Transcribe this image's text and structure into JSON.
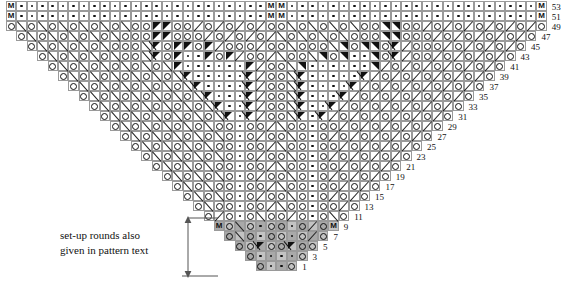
{
  "document": {
    "kind": "knitting-chart",
    "shape": "triangular-shawl-chart",
    "width": 562,
    "height": 281
  },
  "caption": {
    "line1": "set-up rounds also",
    "line2": "given in pattern text"
  },
  "legend_symbols": {
    "yarn_over": "o",
    "purl": "dot",
    "marker": "M",
    "k2tog": "forward-slash",
    "ssk": "back-slash",
    "filled_decrease": "solid-triangle",
    "centered_decrease": "triangle-with-slash",
    "setup_shading_dark": "#a9a9a9",
    "setup_shading_light": "#c3c3c3"
  },
  "colors": {
    "grid_line": "#9a9a9a",
    "grid_line_faint": "#c8c8c8",
    "symbol": "#111111",
    "background": "#ffffff",
    "setup_dark": "#a9a9a9",
    "setup_light": "#c3c3c3"
  },
  "grid": {
    "cell_width": 10.4,
    "cell_height": 10.0,
    "origin_x": 6,
    "origin_y": 1,
    "columns": 52,
    "rows": 27
  },
  "row_numbers": [
    1,
    3,
    5,
    7,
    9,
    11,
    13,
    15,
    17,
    19,
    21,
    23,
    25,
    27,
    29,
    31,
    33,
    35,
    37,
    39,
    41,
    43,
    45,
    47,
    49,
    51,
    53
  ],
  "setup_rows": [
    1,
    3,
    5,
    7,
    9
  ],
  "chart_data": {
    "type": "table",
    "title": "",
    "note": "Triangular lace shawl chart. Rows numbered on the right, odd numbers only, 1 at bottom to 53 at top. Each row grows wider by one stitch on each side of centre. Rows 1-9 are shaded set-up rounds.",
    "rows": [
      {
        "n": 1,
        "half": "o . o",
        "cells": 4
      },
      {
        "n": 3,
        "half": "o . . o",
        "cells": 6
      },
      {
        "n": 5,
        "half": "o o A o o",
        "cells": 8
      },
      {
        "n": 7,
        "half": "o / o . o \\ o",
        "cells": 10
      },
      {
        "n": 9,
        "half": "M o / o . o \\ o",
        "cells": 12
      },
      {
        "n": 11,
        "half": "o \\ o . o / o / o",
        "cells": 14
      },
      {
        "n": 13,
        "half": "o / o o . o o \\ o",
        "cells": 16
      },
      {
        "n": 15,
        "half": "o / o / o . o \\ o \\ o",
        "cells": 18
      },
      {
        "n": 17,
        "half": "o / o / o o . o o \\ o \\ o",
        "cells": 20
      },
      {
        "n": 19,
        "half": "o / o / o / o . o \\ o \\ o \\ o",
        "cells": 22
      },
      {
        "n": 21,
        "half": "o / o / o / o o . o o \\ o \\ o \\ o",
        "cells": 24
      },
      {
        "n": 23,
        "half": "o / o / o / o / o . o \\ o \\ o \\ o \\ o",
        "cells": 26
      },
      {
        "n": 25,
        "half": "o / o / o / o / o o . o o \\ o \\ o \\ o \\ o",
        "cells": 28
      },
      {
        "n": 27,
        "half": "o / o / o / o / o / o . o \\ o \\ o \\ o \\ o \\ o",
        "cells": 30
      },
      {
        "n": 29,
        "half": "o / o / o / o / o / o o . o o \\ o \\ o \\ o \\ o \\ o",
        "cells": 32
      },
      {
        "n": 31,
        "half": "o / o / o / o / o / o / A . A \\ o \\ o \\ o \\ o \\ o \\ o",
        "cells": 34
      },
      {
        "n": 33,
        "half": "o / o / o / o / o / o / A . . A \\ o \\ o \\ o \\ o \\ o \\ o",
        "cells": 36
      },
      {
        "n": 35,
        "half": "o / o / o / o / o / o / A . . . A \\ o \\ o \\ o \\ o \\ o \\ o",
        "cells": 38
      },
      {
        "n": 37,
        "half": "o / o / o / o / o / o / A . . . . A \\ o \\ o \\ o \\ o \\ o \\ o",
        "cells": 40
      },
      {
        "n": 39,
        "half": "o / o / o / o / o / o / A . . . . . A \\ o \\ o \\ o \\ o \\ o \\ o",
        "cells": 42
      },
      {
        "n": 41,
        "half": "o / o / o / o / o / o / T . . . . . . T \\ o \\ o \\ o \\ o \\ o \\ o",
        "cells": 44
      },
      {
        "n": 43,
        "half": "o / o / o / o / o o / A o T . . T o T \\ o o \\ o \\ o \\ o \\ o",
        "cells": 46
      },
      {
        "n": 45,
        "half": "o / o / o / o / o o o / A o T T o T \\ o o o \\ o \\ o \\ o \\ o",
        "cells": 48
      },
      {
        "n": 47,
        "half": "o / o / o / o / o / o o o T T o o o \\ o \\ o \\ o \\ o \\ o",
        "cells": 50
      },
      {
        "n": 49,
        "half": "o / o / o / o / o / o / o o T T o o \\ o \\ o \\ o \\ o \\ o \\ o",
        "cells": 52
      },
      {
        "n": 51,
        "half": "M . . . . . . . . . . . . . . . . . . . . . . . . M",
        "cells": 52
      },
      {
        "n": 53,
        "half": "M . . . . . . . . . . . . . . . . . . . . . . . . M",
        "cells": 52
      }
    ]
  }
}
